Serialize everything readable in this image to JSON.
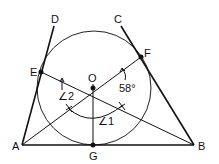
{
  "diagram": {
    "type": "geometry",
    "points": {
      "A": {
        "label": "A",
        "x": 22,
        "y": 145
      },
      "B": {
        "label": "B",
        "x": 194,
        "y": 145
      },
      "C": {
        "label": "C",
        "x": 121,
        "y": 26
      },
      "D": {
        "label": "D",
        "x": 54,
        "y": 26
      },
      "E": {
        "label": "E",
        "x": 41,
        "y": 72
      },
      "F": {
        "label": "F",
        "x": 141,
        "y": 57
      },
      "G": {
        "label": "G",
        "x": 93,
        "y": 145
      },
      "O": {
        "label": "O",
        "x": 93,
        "y": 88
      }
    },
    "circle": {
      "center": "O",
      "cx": 94,
      "cy": 88,
      "r": 57
    },
    "angles": {
      "angle1": "∠1",
      "angle2": "∠2",
      "given": "58°"
    }
  }
}
